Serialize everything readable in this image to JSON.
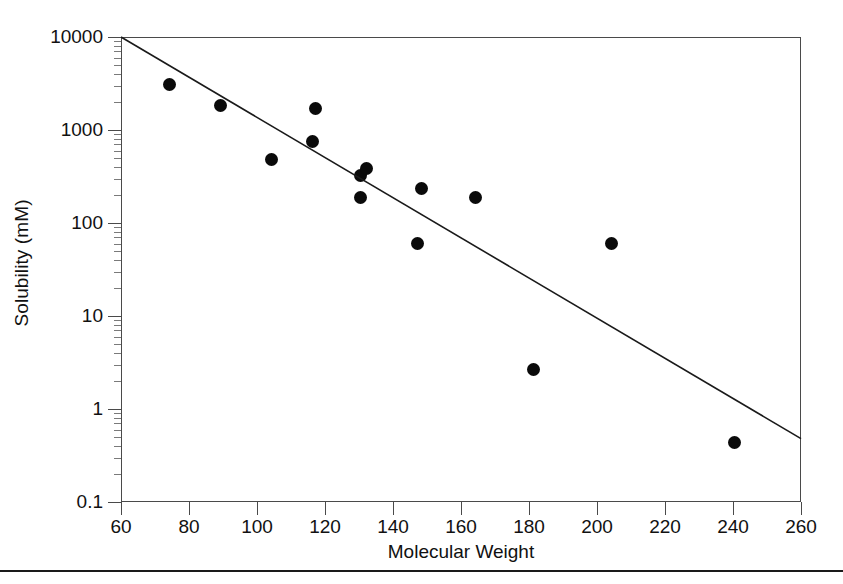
{
  "chart_data": {
    "type": "scatter",
    "title": "",
    "xlabel": "Molecular Weight",
    "ylabel": "Solubility (mM)",
    "xlim": [
      60,
      260
    ],
    "ylim": [
      0.1,
      10000
    ],
    "yscale": "log",
    "xscale": "linear",
    "grid": false,
    "legend": null,
    "xticks": [
      60,
      80,
      100,
      120,
      140,
      160,
      180,
      200,
      220,
      240,
      260
    ],
    "xtick_labels": [
      "60",
      "80",
      "100",
      "120",
      "140",
      "160",
      "180",
      "200",
      "220",
      "240",
      "260"
    ],
    "yticks": [
      0.1,
      1,
      10,
      100,
      1000,
      10000
    ],
    "ytick_labels": [
      "0.1",
      "1",
      "10",
      "100",
      "1000",
      "10000"
    ],
    "series": [
      {
        "name": "compounds",
        "marker": "filled-circle",
        "color": "#0a0a0a",
        "points": [
          {
            "x": 74,
            "y": 3200
          },
          {
            "x": 89,
            "y": 1900
          },
          {
            "x": 104,
            "y": 490
          },
          {
            "x": 116,
            "y": 780
          },
          {
            "x": 117,
            "y": 1750
          },
          {
            "x": 130,
            "y": 195
          },
          {
            "x": 130,
            "y": 330
          },
          {
            "x": 132,
            "y": 400
          },
          {
            "x": 147,
            "y": 62
          },
          {
            "x": 148,
            "y": 240
          },
          {
            "x": 164,
            "y": 195
          },
          {
            "x": 181,
            "y": 2.7
          },
          {
            "x": 204,
            "y": 62
          },
          {
            "x": 240,
            "y": 0.45
          }
        ]
      }
    ],
    "fit_line": {
      "name": "regression-line",
      "color": "#1a1a1a",
      "x_start": 60,
      "y_start": 10000,
      "x_end": 260,
      "y_end": 0.48
    }
  },
  "axes": {
    "x_label": "Molecular Weight",
    "y_label": "Solubility (mM)"
  },
  "caption": {
    "text": ""
  }
}
